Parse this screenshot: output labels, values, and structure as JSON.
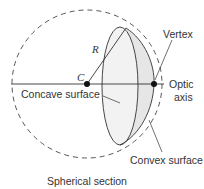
{
  "diagram": {
    "caption": "Spherical section",
    "labels": {
      "radius": "R",
      "center": "C",
      "vertex": "Vertex",
      "optic_axis_line1": "Optic",
      "optic_axis_line2": "axis",
      "concave": "Concave surface",
      "convex": "Convex surface"
    },
    "colors": {
      "stroke": "#333333",
      "fill": "#ececec",
      "background": "#ffffff"
    }
  }
}
